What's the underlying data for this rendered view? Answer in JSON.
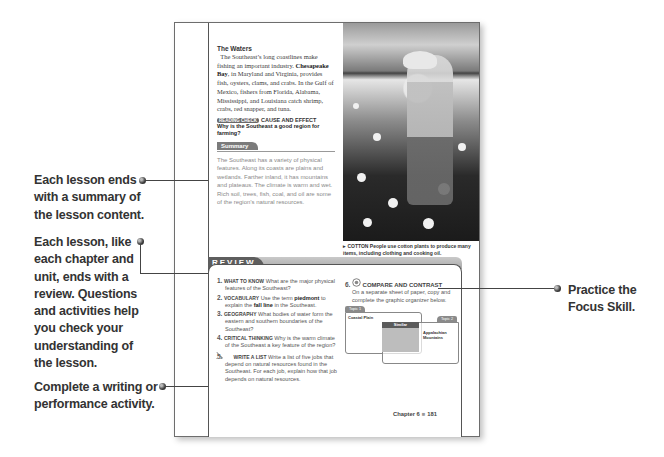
{
  "page": {
    "waters": {
      "heading": "The Waters",
      "pre": "The Southeast’s long coastlines make fishing an important industry. ",
      "bold": "Chesapeake Bay",
      "post": ", in Maryland and Virginia, provides fish, oysters, clams, and crabs. In the Gulf of Mexico, fishers from Florida, Alabama, Mississippi, and Louisiana catch shrimp, crabs, red snapper, and tuna."
    },
    "reading_check": {
      "tag": "READING CHECK",
      "skill": "CAUSE AND EFFECT",
      "question": "Why is the Southeast a good region for farming?"
    },
    "summary": {
      "label": "Summary",
      "text": "The Southeast has a variety of physical features. Along its coasts are plains and wetlands. Farther inland, it has mountains and plateaus. The climate is warm and wet. Rich soil, trees, fish, coal, and oil are some of the region’s natural resources."
    },
    "photo": {
      "caption_tag": "COTTON",
      "caption": "People use cotton plants to produce many items, including clothing and cooking oil."
    },
    "review": {
      "label": "REVIEW",
      "questions": [
        {
          "num": "1.",
          "kw": "WHAT TO KNOW",
          "pre": "What are the major physical features of the Southeast?",
          "bold1": "",
          "mid": "",
          "bold2": "",
          "post": ""
        },
        {
          "num": "2.",
          "kw": "VOCABULARY",
          "pre": "Use the term ",
          "bold1": "piedmont",
          "mid": " to explain the ",
          "bold2": "fall line",
          "post": " in the Southeast."
        },
        {
          "num": "3.",
          "kw": "GEOGRAPHY",
          "pre": "What bodies of water form the eastern and southern boundaries of the Southeast?",
          "bold1": "",
          "mid": "",
          "bold2": "",
          "post": ""
        },
        {
          "num": "4.",
          "kw": "CRITICAL THINKING",
          "pre": "Why is the warm climate of the Southeast a key feature of the region?",
          "bold1": "",
          "mid": "",
          "bold2": "",
          "post": ""
        },
        {
          "num": "5.",
          "kw": "WRITE A LIST",
          "pre": "Write a list of five jobs that depend on natural resources found in the Southeast. For each job, explain how that job depends on natural resources.",
          "bold1": "",
          "mid": "",
          "bold2": "",
          "post": ""
        }
      ],
      "focus": {
        "num": "6.",
        "title": "COMPARE AND CONTRAST",
        "text": "On a separate sheet of paper, copy and complete the graphic organizer below.",
        "organizer": {
          "topic1": "Topic 1",
          "topic2": "Topic 2",
          "left": "Coastal Plain",
          "middle": "Similar",
          "right": "Appalachian Mountains"
        }
      }
    },
    "footer": {
      "chapter": "Chapter 6",
      "sep": "■",
      "page_number": "181"
    }
  },
  "callouts": {
    "summary": "Each lesson ends with a summary of the lesson content.",
    "review": "Each lesson, like each chapter and unit, ends with a review. Questions and activities help you check your understanding of the lesson.",
    "activity": "Complete a writing or performance activity.",
    "focus": "Practice the Focus Skill."
  }
}
